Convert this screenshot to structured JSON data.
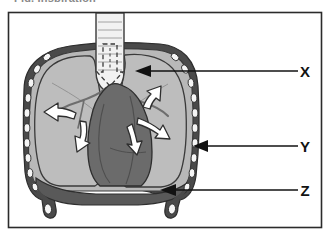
{
  "figure": {
    "title_fragment": "Fig. Inspiration",
    "frame": {
      "border_color": "#2b2b2b",
      "background_color": "#ffffff",
      "x": 8,
      "y": 12,
      "width": 314,
      "height": 216
    }
  },
  "labels": [
    {
      "id": "x",
      "text": "X",
      "refers_to": "lung",
      "text_x": 305,
      "text_y": 77,
      "line_from_x": 298,
      "line_to_x": 137,
      "line_y": 71
    },
    {
      "id": "y",
      "text": "Y",
      "refers_to": "rib-cage",
      "text_x": 305,
      "text_y": 152,
      "line_from_x": 298,
      "line_to_x": 194,
      "line_y": 146
    },
    {
      "id": "z",
      "text": "Z",
      "refers_to": "diaphragm",
      "text_x": 305,
      "text_y": 196,
      "line_from_x": 298,
      "line_to_x": 160,
      "line_y": 190
    }
  ],
  "anatomy": {
    "trachea": {
      "name": "trachea",
      "fill": "#f2f2f2",
      "stroke": "#3a3a3a"
    },
    "lungs": {
      "name": "lungs",
      "fill": "#b8b8b8",
      "stroke": "#3a3a3a"
    },
    "heart": {
      "name": "heart-mediastinum",
      "fill": "#6b6b6b",
      "stroke": "#2e2e2e"
    },
    "diaphragm": {
      "name": "diaphragm",
      "fill": "#595959",
      "stroke": "#2e2e2e"
    },
    "rib_cage": {
      "name": "rib-cage",
      "rib_fill": "#f5f5f5",
      "gap_fill": "#4a4a4a",
      "stroke": "#2e2e2e",
      "rib_count": 11
    }
  },
  "airflow": {
    "inhale_arrow": {
      "name": "inhale-arrow-dashed",
      "direction": "down",
      "style": "dashed-outline"
    },
    "expansion_arrows": {
      "name": "lung-expansion-arrows",
      "count": 5,
      "fill": "#ffffff",
      "stroke": "#2e2e2e"
    }
  },
  "colors": {
    "label_text": "#121212",
    "leader_line": "#121212",
    "frame_border": "#2b2b2b"
  }
}
